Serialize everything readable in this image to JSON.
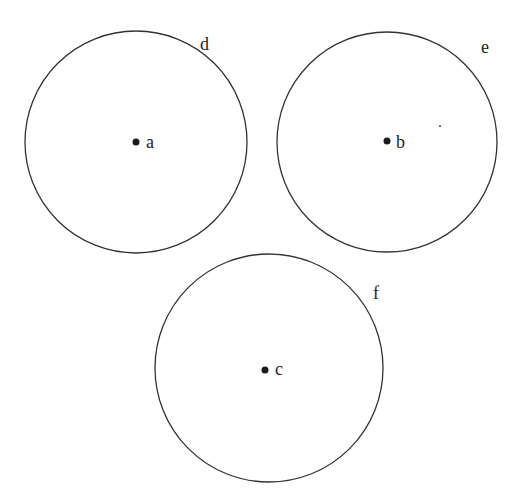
{
  "diagram": {
    "type": "three circles with labeled centers",
    "stroke_color": "#333333",
    "dot_color": "#1a1a1a",
    "circles": [
      {
        "id": "d",
        "label": "d",
        "center_label": "a",
        "cx": 136,
        "cy": 142,
        "r": 111,
        "label_x": 200,
        "label_y": 50,
        "center_label_x": 146,
        "center_label_y": 148
      },
      {
        "id": "e",
        "label": "e",
        "center_label": "b",
        "cx": 387,
        "cy": 142,
        "r": 110,
        "label_x": 481,
        "label_y": 53,
        "center_label_x": 396,
        "center_label_y": 148
      },
      {
        "id": "f",
        "label": "f",
        "center_label": "c",
        "cx": 269,
        "cy": 368,
        "r": 114,
        "label_x": 373,
        "label_y": 299,
        "center_label_x": 276,
        "center_label_y": 375
      }
    ],
    "stray_mark": {
      "x": 440,
      "y": 125
    }
  }
}
